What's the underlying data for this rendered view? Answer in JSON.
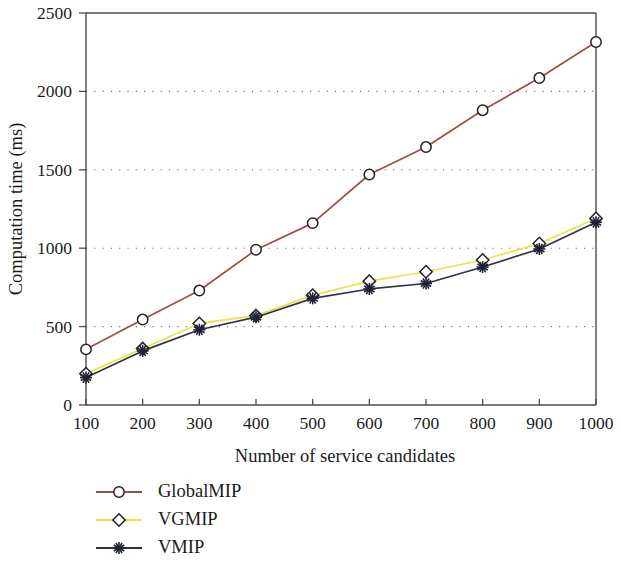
{
  "chart_data": {
    "type": "line",
    "title": "",
    "xlabel": "Number of service candidates",
    "ylabel": "Computation time (ms)",
    "x": [
      100,
      200,
      300,
      400,
      500,
      600,
      700,
      800,
      900,
      1000
    ],
    "xlim": [
      100,
      1000
    ],
    "ylim": [
      0,
      2500
    ],
    "xticks": [
      "100",
      "200",
      "300",
      "400",
      "500",
      "600",
      "700",
      "800",
      "900",
      "1000"
    ],
    "yticks": [
      "0",
      "500",
      "1000",
      "1500",
      "2000",
      "2500"
    ],
    "ytick_values": [
      0,
      500,
      1000,
      1500,
      2000,
      2500
    ],
    "gridlines_y": [
      500,
      1000,
      1500,
      2000
    ],
    "grid": "horizontal-dotted",
    "legend_position": "below-left",
    "series": [
      {
        "name": "GlobalMIP",
        "color": "#9e4f46",
        "marker": "circle",
        "values": [
          355,
          545,
          730,
          990,
          1160,
          1470,
          1645,
          1880,
          2085,
          2315
        ]
      },
      {
        "name": "VGMIP",
        "color": "#e8e34a",
        "marker": "diamond",
        "values": [
          200,
          360,
          520,
          570,
          700,
          790,
          850,
          925,
          1030,
          1190
        ]
      },
      {
        "name": "VMIP",
        "color": "#2f3348",
        "marker": "star",
        "values": [
          175,
          345,
          480,
          560,
          680,
          740,
          775,
          880,
          995,
          1165
        ]
      }
    ]
  },
  "legend": {
    "entries": [
      {
        "label": "GlobalMIP"
      },
      {
        "label": "VGMIP"
      },
      {
        "label": "VMIP"
      }
    ]
  },
  "axes": {
    "x_title": "Number of service candidates",
    "y_title": "Computation time (ms)"
  }
}
